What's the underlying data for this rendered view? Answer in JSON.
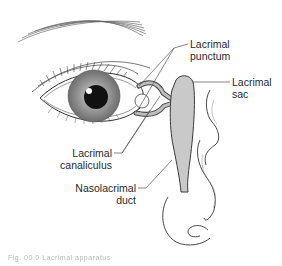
{
  "figure": {
    "labels": {
      "punctum": {
        "line1": "Lacrimal",
        "line2": "punctum"
      },
      "sac": {
        "line1": "Lacrimal",
        "line2": "sac"
      },
      "canaliculus": {
        "line1": "Lacrimal",
        "line2": "canaliculus"
      },
      "nasolacrimal": {
        "line1": "Nasolacrimal",
        "line2": "duct"
      }
    },
    "caption": "Fig. 00.0  Lacrimal apparatus"
  },
  "colors": {
    "line": "#3a3a3a",
    "duct_fill": "#c9c9c9",
    "iris": "#8a8a8a",
    "pupil": "#111111",
    "leader": "#555555"
  }
}
